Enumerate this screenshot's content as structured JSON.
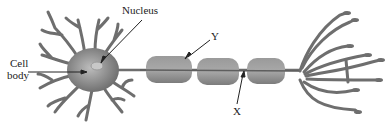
{
  "diagram": {
    "labels": {
      "nucleus": "Nucleus",
      "cell_body_line1": "Cell",
      "cell_body_line2": "body",
      "y": "Y",
      "x": "X"
    },
    "parts": [
      "dendrites",
      "cell body",
      "nucleus",
      "axon",
      "myelin sheath (Y)",
      "node of Ranvier (X)",
      "axon terminals"
    ],
    "colors": {
      "cell": "#7a7a7a",
      "myelin": "#8c8c8c",
      "branch": "#6e6e6e",
      "text": "#222222"
    }
  }
}
